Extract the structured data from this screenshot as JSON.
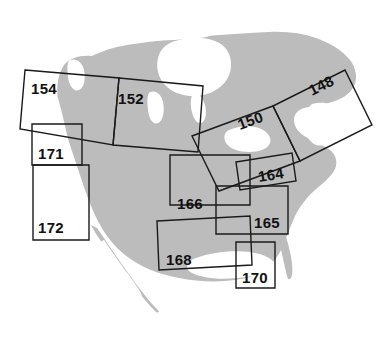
{
  "figure": {
    "name": "north-america-map-sheet-index",
    "background_color": "#ffffff",
    "land_color": "#bcbcbc",
    "water_color": "#ffffff",
    "outline_color": "#1a1a1a"
  },
  "sheets": [
    {
      "id": "sheet-154",
      "label": "154",
      "label_x": 31,
      "label_y": 94,
      "points": "25,70 119,78 113,145 20,129",
      "rotation": "tilted"
    },
    {
      "id": "sheet-152",
      "label": "152",
      "label_x": 118,
      "label_y": 104,
      "points": "119,78 203,86 198,152 113,145",
      "rotation": "tilted"
    },
    {
      "id": "sheet-148",
      "label": "148",
      "label_x": 312,
      "label_y": 96,
      "points": "273,106 345,70 372,125 300,161",
      "rotation": "rotated"
    },
    {
      "id": "sheet-150",
      "label": "150",
      "label_x": 243,
      "label_y": 125,
      "points": "192,136 273,106 300,161 219,191",
      "rotation": "rotated"
    },
    {
      "id": "sheet-171",
      "label": "171",
      "label_x": 38,
      "label_y": 159,
      "points": "32,124 82,124 82,165 32,165",
      "rotation": "axis-aligned"
    },
    {
      "id": "sheet-172",
      "label": "172",
      "label_x": 38,
      "label_y": 233,
      "points": "33,165 89,165 89,240 33,240",
      "rotation": "axis-aligned"
    },
    {
      "id": "sheet-166",
      "label": "166",
      "label_x": 177,
      "label_y": 209,
      "points": "170,155 250,155 250,205 170,205",
      "rotation": "axis-aligned"
    },
    {
      "id": "sheet-164",
      "label": "164",
      "label_x": 262,
      "label_y": 180,
      "points": "236,162 292,153 296,181 240,190",
      "rotation": "tilted"
    },
    {
      "id": "sheet-165",
      "label": "165",
      "label_x": 254,
      "label_y": 228,
      "points": "216,186 288,186 288,234 216,234",
      "rotation": "axis-aligned"
    },
    {
      "id": "sheet-168",
      "label": "168",
      "label_x": 166,
      "label_y": 265,
      "points": "157,221 250,216 252,265 159,270",
      "rotation": "tilted"
    },
    {
      "id": "sheet-170",
      "label": "170",
      "label_x": 242,
      "label_y": 283,
      "points": "236,242 275,242 275,288 236,288",
      "rotation": "axis-aligned"
    }
  ],
  "land_shapes": {
    "main_continent": "M 88,57 L 120,48 L 160,44 L 205,40 L 248,36 L 282,32 L 310,34 L 330,42 L 345,52 L 352,66 L 348,80 L 335,88 L 318,92 L 300,95 L 292,105 L 296,118 L 306,128 L 318,132 L 330,136 L 336,146 L 330,158 L 318,166 L 306,176 L 298,190 L 292,206 L 286,222 L 280,238 L 272,252 L 262,262 L 250,268 L 236,272 L 220,274 L 200,274 L 182,272 L 164,268 L 148,262 L 134,254 L 122,244 L 112,232 L 104,218 L 98,204 L 92,190 L 86,176 L 80,162 L 74,148 L 68,134 L 62,120 L 58,106 L 58,92 L 62,78 L 70,66 Z",
    "baja_peninsula": "M 98,232 L 106,244 L 116,258 L 128,272 L 140,286 L 150,298 L 156,306 L 150,308 L 140,298 L 128,284 L 116,268 L 106,252 L 98,240 Z",
    "hudson_bay": "M 168,44 L 196,40 L 216,44 L 226,56 L 224,70 L 214,80 L 198,86 L 182,84 L 170,74 L 164,60 Z",
    "great_lakes": "M 232,132 L 248,128 L 262,132 L 268,142 L 260,150 L 244,152 L 232,146 Z",
    "arctic_islands": "M 208,22 L 240,18 L 268,22 L 282,30 L 268,34 L 240,32 L 212,30 Z"
  }
}
